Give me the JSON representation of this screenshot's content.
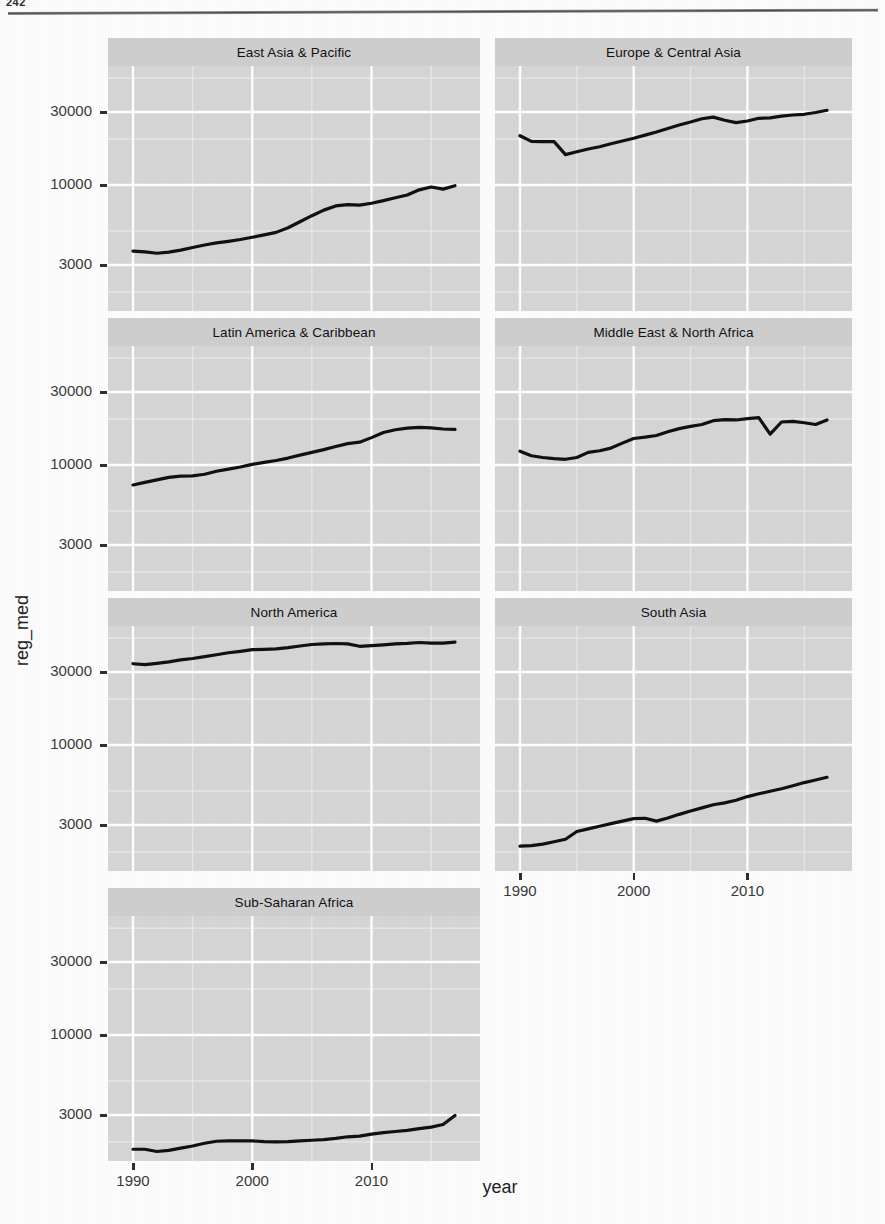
{
  "page": {
    "page_number": "242",
    "has_horizontal_rule": true
  },
  "axis_titles": {
    "x": "year",
    "y": "reg_med"
  },
  "ticks": {
    "y_labels": [
      "30000",
      "10000",
      "3000"
    ],
    "x_labels": [
      "1990",
      "2000",
      "2010"
    ]
  },
  "colors": {
    "panel_background": "#d6d6d6",
    "strip_background": "#cfcfcf",
    "gridline_major": "#ffffff",
    "gridline_minor": "#eaeaea",
    "line": "#111111",
    "tick_text": "#3a3a3a",
    "axis_title": "#242424"
  },
  "chart_data": {
    "type": "line",
    "title": "",
    "subtitle": "",
    "xlabel": "year",
    "ylabel": "reg_med",
    "facet_layout": {
      "ncol": 2,
      "nrow": 4,
      "facet_variable": "region"
    },
    "x_scale": "linear",
    "y_scale": "log10",
    "xlim": [
      1990,
      2017
    ],
    "ylim": [
      1500,
      60000
    ],
    "x_ticks": [
      1990,
      2000,
      2010
    ],
    "y_ticks": [
      3000,
      10000,
      30000
    ],
    "grid": true,
    "grid_minor": true,
    "legend": "none",
    "x": [
      1990,
      1991,
      1992,
      1993,
      1994,
      1995,
      1996,
      1997,
      1998,
      1999,
      2000,
      2001,
      2002,
      2003,
      2004,
      2005,
      2006,
      2007,
      2008,
      2009,
      2010,
      2011,
      2012,
      2013,
      2014,
      2015,
      2016,
      2017
    ],
    "series": [
      {
        "name": "East Asia & Pacific",
        "facet": "East Asia & Pacific",
        "values": [
          3700,
          3650,
          3580,
          3640,
          3750,
          3900,
          4050,
          4180,
          4280,
          4400,
          4550,
          4720,
          4900,
          5250,
          5750,
          6300,
          6850,
          7300,
          7450,
          7380,
          7600,
          7900,
          8250,
          8600,
          9300,
          9700,
          9400,
          9900
        ]
      },
      {
        "name": "Europe & Central Asia",
        "facet": "Europe & Central Asia",
        "values": [
          21000,
          19300,
          19200,
          19200,
          15800,
          16500,
          17200,
          17800,
          18600,
          19400,
          20200,
          21200,
          22200,
          23400,
          24700,
          25800,
          27100,
          27800,
          26500,
          25600,
          26200,
          27300,
          27500,
          28200,
          28700,
          29000,
          29800,
          30800
        ]
      },
      {
        "name": "Latin America & Caribbean",
        "facet": "Latin America & Caribbean",
        "values": [
          7400,
          7700,
          8000,
          8300,
          8450,
          8500,
          8700,
          9100,
          9400,
          9700,
          10100,
          10400,
          10700,
          11100,
          11600,
          12100,
          12600,
          13200,
          13800,
          14100,
          15100,
          16300,
          17000,
          17400,
          17600,
          17500,
          17200,
          17100
        ]
      },
      {
        "name": "Middle East & North Africa",
        "facet": "Middle East & North Africa",
        "values": [
          12300,
          11500,
          11200,
          11000,
          10900,
          11200,
          12100,
          12400,
          12900,
          13900,
          14900,
          15200,
          15600,
          16500,
          17300,
          17900,
          18400,
          19500,
          19800,
          19700,
          20100,
          20400,
          15900,
          19100,
          19300,
          18900,
          18400,
          19700
        ]
      },
      {
        "name": "North America",
        "facet": "North America",
        "values": [
          34000,
          33500,
          34200,
          35000,
          36000,
          36800,
          37800,
          38900,
          40100,
          41000,
          42000,
          42200,
          42500,
          43300,
          44400,
          45400,
          45900,
          46100,
          45800,
          44200,
          44700,
          45200,
          45800,
          46200,
          46800,
          46300,
          46400,
          47000
        ]
      },
      {
        "name": "South Asia",
        "facet": "South Asia",
        "values": [
          2180,
          2200,
          2250,
          2330,
          2420,
          2720,
          2830,
          2940,
          3060,
          3180,
          3300,
          3320,
          3180,
          3330,
          3520,
          3700,
          3880,
          4070,
          4180,
          4350,
          4600,
          4800,
          4980,
          5180,
          5420,
          5680,
          5900,
          6150
        ]
      },
      {
        "name": "Sub-Saharan Africa",
        "facet": "Sub-Saharan Africa",
        "values": [
          1790,
          1790,
          1730,
          1760,
          1820,
          1880,
          1960,
          2020,
          2030,
          2030,
          2030,
          2010,
          2000,
          2010,
          2030,
          2050,
          2070,
          2110,
          2160,
          2180,
          2250,
          2300,
          2340,
          2380,
          2440,
          2500,
          2600,
          2980
        ]
      }
    ]
  },
  "facets": [
    {
      "label": "East Asia & Pacific",
      "col": 0,
      "row": 0,
      "show_x_axis": false
    },
    {
      "label": "Europe & Central Asia",
      "col": 1,
      "row": 0,
      "show_x_axis": false
    },
    {
      "label": "Latin America & Caribbean",
      "col": 0,
      "row": 1,
      "show_x_axis": false
    },
    {
      "label": "Middle East & North Africa",
      "col": 1,
      "row": 1,
      "show_x_axis": false
    },
    {
      "label": "North America",
      "col": 0,
      "row": 2,
      "show_x_axis": false
    },
    {
      "label": "South Asia",
      "col": 1,
      "row": 2,
      "show_x_axis": true
    },
    {
      "label": "Sub-Saharan Africa",
      "col": 0,
      "row": 3,
      "show_x_axis": true
    }
  ]
}
